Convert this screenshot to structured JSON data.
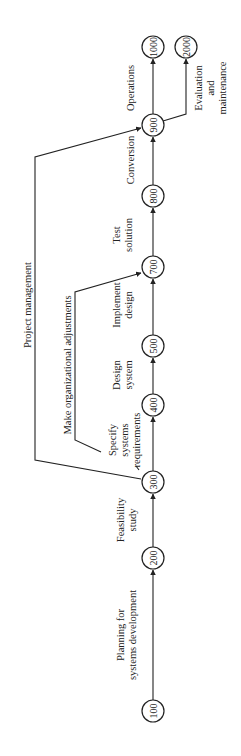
{
  "diagram": {
    "type": "network-diagram",
    "orientation": "rotated-90-ccw",
    "nodes": [
      {
        "id": "100",
        "label": "100",
        "x": 153,
        "y": 711
      },
      {
        "id": "200",
        "label": "200",
        "x": 153,
        "y": 558
      },
      {
        "id": "300",
        "label": "300",
        "x": 153,
        "y": 482
      },
      {
        "id": "400",
        "label": "400",
        "x": 153,
        "y": 405
      },
      {
        "id": "500",
        "label": "500",
        "x": 153,
        "y": 346
      },
      {
        "id": "700",
        "label": "700",
        "x": 153,
        "y": 267
      },
      {
        "id": "800",
        "label": "800",
        "x": 153,
        "y": 196
      },
      {
        "id": "900",
        "label": "900",
        "x": 153,
        "y": 125
      },
      {
        "id": "1000",
        "label": "1000",
        "x": 153,
        "y": 47
      },
      {
        "id": "2000",
        "label": "2000",
        "x": 186,
        "y": 47
      }
    ],
    "activities": [
      {
        "from": "100",
        "to": "200",
        "label": [
          "Planning for",
          "systems development"
        ]
      },
      {
        "from": "200",
        "to": "300",
        "label": [
          "Feasibility",
          "study"
        ]
      },
      {
        "from": "300",
        "to": "400",
        "label": [
          "Specify",
          "systems",
          "requirements"
        ]
      },
      {
        "from": "400",
        "to": "500",
        "label": [
          "Design",
          "system"
        ]
      },
      {
        "from": "500",
        "to": "700",
        "label": [
          "Implement",
          "design"
        ]
      },
      {
        "from": "700",
        "to": "800",
        "label": [
          "Test",
          "solution"
        ]
      },
      {
        "from": "800",
        "to": "900",
        "label": [
          "Conversion"
        ]
      },
      {
        "from": "900",
        "to": "1000",
        "label": [
          "Operations"
        ]
      },
      {
        "from": "900",
        "to": "2000",
        "label": [
          "Evaluation",
          "and",
          "maintenance"
        ]
      },
      {
        "from": "300",
        "to": "700",
        "label": [
          "Make organizational adjustments"
        ]
      },
      {
        "from": "300",
        "to": "900",
        "label": [
          "Project management"
        ]
      }
    ]
  }
}
